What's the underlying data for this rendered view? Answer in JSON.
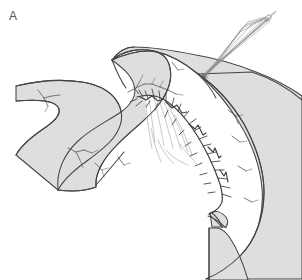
{
  "figure": {
    "panel_label": "A",
    "caption_text": "",
    "background_color": "#ffffff"
  },
  "palette": {
    "organ_fill": "#dedede",
    "organ_outline": "#454545",
    "vessel_stroke": "#5e5e5e",
    "suture_stroke": "#3c3c3c",
    "thread_stroke": "#8c8c8c",
    "mucosa_stroke": "#9a9a9a",
    "label_color": "#555555"
  },
  "elements": {
    "left_bowel_limb": "left-bowel-limb",
    "middle_bowel_loop": "middle-bowel-loop",
    "right_bowel_limb": "right-bowel-limb",
    "anastomosis_suture_line": "anastomosis-suture-line",
    "suture_thread_bundle": "suture-thread-bundle",
    "needle": "needle",
    "cut_edge": "cut-edge",
    "mesenteric_vessels": "mesenteric-vessels"
  }
}
